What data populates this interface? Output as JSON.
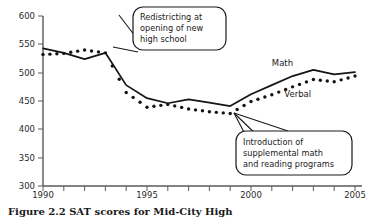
{
  "chart_data": {
    "type": "line",
    "title": "",
    "xlabel": "",
    "ylabel": "",
    "xlim": [
      1989.5,
      2005.5
    ],
    "ylim": [
      300,
      600
    ],
    "grid": false,
    "legend_position": "inline-series-labels",
    "y_ticks": [
      300,
      350,
      400,
      450,
      500,
      550,
      600
    ],
    "x_ticks": [
      1990,
      1995,
      2000,
      2005
    ],
    "x_minor_tick_interval": 1,
    "x": [
      1990,
      1991,
      1992,
      1993,
      1994,
      1995,
      1996,
      1997,
      1998,
      1999,
      2000,
      2001,
      2002,
      2003,
      2004,
      2005
    ],
    "series": [
      {
        "name": "Math",
        "style": "solid-line",
        "values": [
          543,
          535,
          524,
          535,
          478,
          455,
          446,
          453,
          447,
          441,
          462,
          478,
          494,
          505,
          497,
          501
        ]
      },
      {
        "name": "Verbal",
        "style": "dotted-markers",
        "values": [
          532,
          534,
          540,
          535,
          465,
          439,
          444,
          436,
          431,
          428,
          449,
          461,
          475,
          488,
          484,
          494
        ]
      }
    ],
    "series_labels": [
      {
        "text": "Math",
        "x": 2001.0,
        "y": 512
      },
      {
        "text": "Verbal",
        "x": 2001.6,
        "y": 458
      }
    ],
    "annotations": [
      {
        "id": "redistricting",
        "lines": [
          "Redistricting at",
          "opening of new",
          "high school"
        ],
        "points_to": {
          "x": 1993.0,
          "y": 535
        }
      },
      {
        "id": "supplemental-programs",
        "lines": [
          "Introduction of",
          "supplemental math",
          "and reading programs"
        ],
        "points_to": {
          "x": 1999.0,
          "y": 432
        }
      }
    ]
  },
  "caption": {
    "text": "Figure 2.2  SAT scores for Mid-City High"
  }
}
